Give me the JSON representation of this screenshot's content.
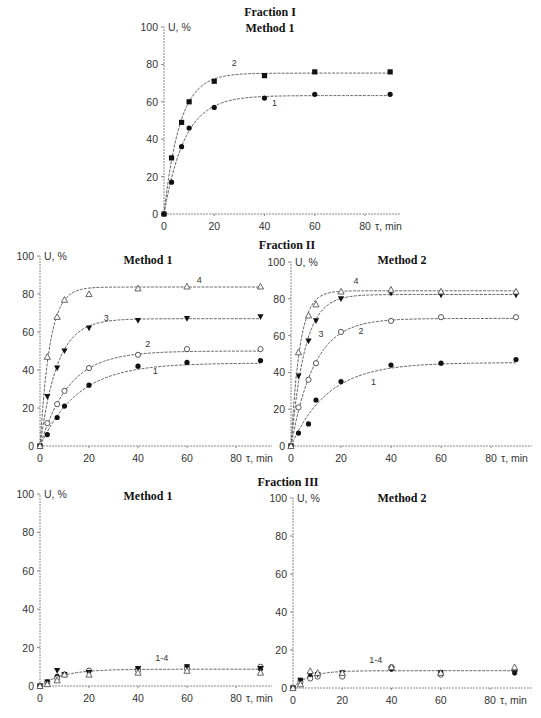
{
  "figure": {
    "fraction_titles": [
      "Fraction I",
      "Fraction II",
      "Fraction III"
    ]
  },
  "chart_data": [
    {
      "id": "f1m1",
      "type": "line",
      "fraction": "Fraction I",
      "title": "Method 1",
      "xlabel": "τ, min",
      "ylabel": "U, %",
      "xlim": [
        0,
        90
      ],
      "ylim": [
        0,
        100
      ],
      "xticks": [
        0,
        20,
        40,
        60,
        80
      ],
      "yticks": [
        0,
        20,
        40,
        60,
        80,
        100
      ],
      "grid": false,
      "series": [
        {
          "name": "1",
          "marker": "filled-circle",
          "x": [
            0,
            3,
            7,
            10,
            20,
            40,
            60,
            90
          ],
          "y": [
            0,
            17,
            36,
            46,
            57,
            62,
            64,
            64
          ],
          "label_at": [
            43,
            58
          ]
        },
        {
          "name": "2",
          "marker": "filled-square",
          "x": [
            0,
            3,
            7,
            10,
            20,
            40,
            60,
            90
          ],
          "y": [
            0,
            30,
            49,
            60,
            71,
            74,
            76,
            76
          ],
          "label_at": [
            27,
            79
          ]
        }
      ]
    },
    {
      "id": "f2m1",
      "type": "line",
      "fraction": "Fraction II",
      "title": "Method 1",
      "xlabel": "τ, min",
      "ylabel": "U, %",
      "xlim": [
        0,
        90
      ],
      "ylim": [
        0,
        100
      ],
      "xticks": [
        0,
        20,
        40,
        60,
        80
      ],
      "yticks": [
        0,
        20,
        40,
        60,
        80,
        100
      ],
      "grid": false,
      "series": [
        {
          "name": "1",
          "marker": "filled-circle",
          "x": [
            0,
            3,
            7,
            10,
            20,
            40,
            60,
            90
          ],
          "y": [
            0,
            6,
            15,
            21,
            32,
            42,
            44,
            45
          ],
          "label_at": [
            46,
            38
          ]
        },
        {
          "name": "2",
          "marker": "open-circle",
          "x": [
            0,
            3,
            7,
            10,
            20,
            40,
            60,
            90
          ],
          "y": [
            0,
            12,
            22,
            29,
            41,
            48,
            51,
            51
          ],
          "label_at": [
            43,
            52
          ]
        },
        {
          "name": "3",
          "marker": "filled-down-triangle",
          "x": [
            0,
            3,
            7,
            10,
            20,
            40,
            60,
            90
          ],
          "y": [
            0,
            26,
            41,
            50,
            62,
            66,
            67,
            68
          ],
          "label_at": [
            26,
            66
          ]
        },
        {
          "name": "4",
          "marker": "open-triangle",
          "x": [
            0,
            3,
            7,
            10,
            20,
            40,
            60,
            90
          ],
          "y": [
            0,
            47,
            68,
            77,
            80,
            83,
            84,
            84
          ],
          "label_at": [
            64,
            86
          ]
        }
      ]
    },
    {
      "id": "f2m2",
      "type": "line",
      "fraction": "Fraction II",
      "title": "Method 2",
      "xlabel": "τ, min",
      "ylabel": "U, %",
      "xlim": [
        0,
        90
      ],
      "ylim": [
        0,
        100
      ],
      "xticks": [
        0,
        20,
        40,
        60,
        80
      ],
      "yticks": [
        0,
        20,
        40,
        60,
        80,
        100
      ],
      "grid": false,
      "series": [
        {
          "name": "1",
          "marker": "filled-circle",
          "x": [
            0,
            3,
            7,
            10,
            20,
            40,
            60,
            90
          ],
          "y": [
            0,
            7,
            12,
            25,
            35,
            44,
            45,
            47
          ],
          "label_at": [
            32,
            33
          ]
        },
        {
          "name": "2",
          "marker": "open-circle",
          "x": [
            0,
            3,
            7,
            10,
            20,
            40,
            60,
            90
          ],
          "y": [
            0,
            21,
            36,
            45,
            62,
            68,
            70,
            70
          ],
          "label_at": [
            27,
            61
          ]
        },
        {
          "name": "3",
          "marker": "filled-down-triangle",
          "x": [
            0,
            3,
            7,
            10,
            20,
            40,
            60,
            90
          ],
          "y": [
            0,
            38,
            57,
            68,
            80,
            83,
            82,
            82
          ],
          "label_at": [
            11,
            59
          ]
        },
        {
          "name": "4",
          "marker": "open-triangle",
          "x": [
            0,
            3,
            7,
            10,
            20,
            40,
            60,
            90
          ],
          "y": [
            0,
            51,
            71,
            77,
            84,
            85,
            84,
            84
          ],
          "label_at": [
            25,
            88
          ]
        }
      ]
    },
    {
      "id": "f3m1",
      "type": "line",
      "fraction": "Fraction III",
      "title": "Method 1",
      "xlabel": "τ, min",
      "ylabel": "U, %",
      "xlim": [
        0,
        90
      ],
      "ylim": [
        0,
        100
      ],
      "xticks": [
        0,
        20,
        40,
        60,
        80
      ],
      "yticks": [
        0,
        20,
        40,
        60,
        80,
        100
      ],
      "grid": false,
      "curve_label": "1-4",
      "curve_label_at": [
        47,
        13
      ],
      "series": [
        {
          "name": "1",
          "marker": "filled-circle",
          "x": [
            0,
            3,
            7,
            10,
            20,
            40,
            60,
            90
          ],
          "y": [
            0,
            2,
            5,
            6,
            8,
            9,
            10,
            9
          ]
        },
        {
          "name": "2",
          "marker": "open-circle",
          "x": [
            0,
            3,
            7,
            10,
            20,
            40,
            60,
            90
          ],
          "y": [
            0,
            2,
            4,
            6,
            8,
            8,
            9,
            10
          ]
        },
        {
          "name": "3",
          "marker": "filled-down-triangle",
          "x": [
            0,
            3,
            7,
            10,
            20,
            40,
            60,
            90
          ],
          "y": [
            0,
            2,
            8,
            6,
            7,
            9,
            10,
            9
          ]
        },
        {
          "name": "4",
          "marker": "open-triangle",
          "x": [
            0,
            3,
            7,
            10,
            20,
            40,
            60,
            90
          ],
          "y": [
            0,
            1,
            3,
            6,
            6,
            7,
            8,
            7
          ]
        }
      ]
    },
    {
      "id": "f3m2",
      "type": "line",
      "fraction": "Fraction III",
      "title": "Method 2",
      "xlabel": "τ, min",
      "ylabel": "U, %",
      "xlim": [
        0,
        90
      ],
      "ylim": [
        0,
        100
      ],
      "xticks": [
        0,
        20,
        40,
        60,
        80
      ],
      "yticks": [
        0,
        20,
        40,
        60,
        80,
        100
      ],
      "grid": false,
      "curve_label": "1-4",
      "curve_label_at": [
        31,
        13
      ],
      "series": [
        {
          "name": "1",
          "marker": "filled-circle",
          "x": [
            0,
            3,
            7,
            10,
            20,
            40,
            60,
            90
          ],
          "y": [
            0,
            4,
            6,
            7,
            7,
            10,
            8,
            8
          ]
        },
        {
          "name": "2",
          "marker": "open-circle",
          "x": [
            0,
            3,
            7,
            10,
            20,
            40,
            60,
            90
          ],
          "y": [
            0,
            3,
            5,
            6,
            6,
            11,
            7,
            9
          ]
        },
        {
          "name": "3",
          "marker": "filled-down-triangle",
          "x": [
            0,
            3,
            7,
            10,
            20,
            40,
            60,
            90
          ],
          "y": [
            0,
            4,
            7,
            7,
            8,
            10,
            8,
            8
          ]
        },
        {
          "name": "4",
          "marker": "open-triangle",
          "x": [
            0,
            3,
            7,
            10,
            20,
            40,
            60,
            90
          ],
          "y": [
            0,
            2,
            9,
            8,
            8,
            11,
            8,
            11
          ]
        }
      ]
    }
  ]
}
